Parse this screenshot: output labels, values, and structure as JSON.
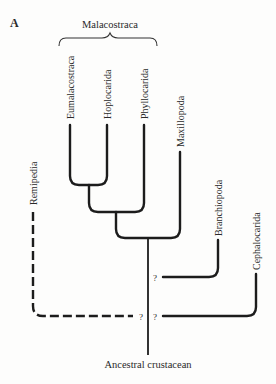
{
  "figure": {
    "panel_label": "A",
    "group_label": "Malacostraca",
    "root_label": "Ancestral crustacean",
    "uncertain_marker": "?"
  },
  "taxa": [
    {
      "name": "Eumalacostraca",
      "group": "Malacostraca"
    },
    {
      "name": "Hoplocarida",
      "group": "Malacostraca"
    },
    {
      "name": "Phyllocarida",
      "group": "Malacostraca"
    },
    {
      "name": "Maxillopoda"
    },
    {
      "name": "Branchiopoda",
      "uncertain": true
    },
    {
      "name": "Cephalocarida",
      "uncertain": true
    },
    {
      "name": "Remipedia",
      "uncertain": true,
      "dashed": true
    }
  ],
  "tree": {
    "topology": "(((((Eumalacostraca,Hoplocarida),Phyllocarida),Maxillopoda),?Branchiopoda,?Cephalocarida,?Remipedia)Ancestral crustacean)"
  }
}
